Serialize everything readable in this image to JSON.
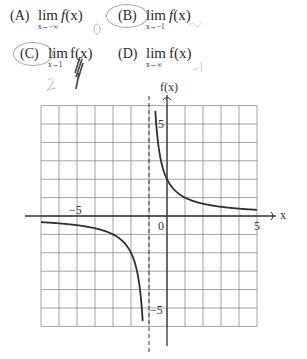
{
  "question": {
    "choices": [
      {
        "id": "A",
        "letter": "(A)",
        "lim": "lim",
        "approach": "x→−∞",
        "func_name": "f",
        "func_arg": "(x)",
        "circled": false
      },
      {
        "id": "B",
        "letter": "(B)",
        "lim": "lim",
        "approach": "x→−1",
        "func_name": "f",
        "func_arg": "(x)",
        "circled": true
      },
      {
        "id": "C",
        "letter": "(C)",
        "lim": "lim",
        "approach": "x→1",
        "func_name": "f",
        "func_arg": "(x)",
        "circled": true
      },
      {
        "id": "D",
        "letter": "(D)",
        "lim": "lim",
        "approach": "x→∞",
        "func_name": "f",
        "func_arg": "(x)",
        "circled": false
      }
    ]
  },
  "handwritten_notes": {
    "near_A": "0",
    "near_B": "DNE",
    "near_C": "2",
    "near_D": "0"
  },
  "graph": {
    "y_axis_label": "f(x)",
    "x_axis_label": "x",
    "tick_labels": {
      "x_neg5": "−5",
      "x_0": "0",
      "x_5": "5",
      "y_5": "5",
      "y_neg5": "−5"
    }
  },
  "chart_data": {
    "type": "line",
    "title": "",
    "xlabel": "x",
    "ylabel": "f(x)",
    "xlim": [
      -7,
      5
    ],
    "ylim": [
      -6,
      6
    ],
    "grid": true,
    "x_ticks_labeled": [
      -5,
      0,
      5
    ],
    "y_ticks_labeled": [
      -5,
      5
    ],
    "vertical_asymptote": {
      "x": -1,
      "style": "dashed"
    },
    "horizontal_asymptote": {
      "y": 0
    },
    "function_approx": "f(x) = 2/(x+1)",
    "series": [
      {
        "name": "right branch",
        "x": [
          -0.65,
          -0.5,
          -0.25,
          0,
          0.5,
          1,
          2,
          3,
          4,
          5
        ],
        "y": [
          5.7,
          4.0,
          2.67,
          2.0,
          1.33,
          1.0,
          0.67,
          0.5,
          0.4,
          0.33
        ]
      },
      {
        "name": "left branch",
        "x": [
          -7,
          -6,
          -5,
          -4,
          -3,
          -2,
          -1.5,
          -1.35
        ],
        "y": [
          -0.33,
          -0.4,
          -0.5,
          -0.67,
          -1.0,
          -2.0,
          -4.0,
          -5.7
        ]
      }
    ]
  }
}
